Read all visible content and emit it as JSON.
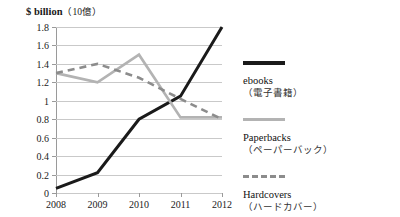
{
  "chart_data": {
    "type": "line",
    "title": "$ billion（10億）",
    "title_en": "$ billion",
    "title_jp": "（10億）",
    "xlabel": "",
    "ylabel": "$ billion",
    "x": [
      "2008",
      "2009",
      "2010",
      "2011",
      "2012"
    ],
    "categories": [
      "2008",
      "2009",
      "2010",
      "2011",
      "2012"
    ],
    "ylim": [
      0,
      1.8
    ],
    "ytick_labels": [
      "0",
      "0.2",
      "0.4",
      "0.6",
      "0.8",
      "1",
      "1.2",
      "1.4",
      "1.6",
      "1.8"
    ],
    "ytick_values": [
      0,
      0.2,
      0.4,
      0.6,
      0.8,
      1.0,
      1.2,
      1.4,
      1.6,
      1.8
    ],
    "grid": true,
    "legend_position": "right",
    "series": [
      {
        "name": "ebooks",
        "name_jp": "（電子書籍）",
        "values": [
          0.05,
          0.22,
          0.8,
          1.05,
          1.8
        ],
        "color": "#1a1a1a",
        "style": "solid",
        "width": 3
      },
      {
        "name": "Paperbacks",
        "name_jp": "（ペーパーバック）",
        "values": [
          1.3,
          1.2,
          1.5,
          0.82,
          0.82
        ],
        "color": "#b3b3b3",
        "style": "solid",
        "width": 2.6
      },
      {
        "name": "Hardcovers",
        "name_jp": "（ハードカバー）",
        "values": [
          1.3,
          1.4,
          1.25,
          1.02,
          0.8
        ],
        "color": "#8c8c8c",
        "style": "dashed",
        "width": 2.6
      }
    ]
  },
  "legend": {
    "items": [
      {
        "label": "ebooks",
        "sub": "（電子書籍）"
      },
      {
        "label": "Paperbacks",
        "sub": "（ペーパーバック）"
      },
      {
        "label": "Hardcovers",
        "sub": "（ハードカバー）"
      }
    ]
  }
}
